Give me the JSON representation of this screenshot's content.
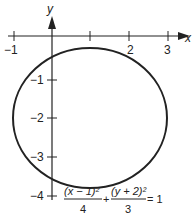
{
  "axes": {
    "x_label": "x",
    "y_label": "y",
    "x_ticks": [
      {
        "value": -1,
        "label": "−1"
      },
      {
        "value": 1,
        "label": ""
      },
      {
        "value": 2,
        "label": "2"
      },
      {
        "value": 3,
        "label": "3"
      }
    ],
    "y_ticks": [
      {
        "value": -1,
        "label": "−1"
      },
      {
        "value": -2,
        "label": "−2"
      },
      {
        "value": -3,
        "label": "−3"
      },
      {
        "value": -4,
        "label": "−4"
      }
    ]
  },
  "curve": {
    "type": "ellipse",
    "center": [
      1,
      -2
    ],
    "semi_axis_x": 2,
    "semi_axis_y": 1.732,
    "color": "#222222"
  },
  "equation": {
    "num1": "(x − 1)²",
    "den1": "4",
    "plus": "+",
    "num2": "(y + 2)²",
    "den2": "3",
    "rhs": "= 1"
  }
}
